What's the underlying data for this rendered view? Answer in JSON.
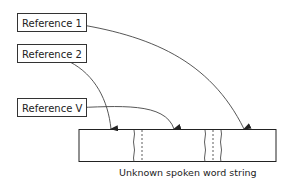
{
  "diagram": {
    "references": [
      {
        "label": "Reference 1"
      },
      {
        "label": "Reference 2"
      },
      {
        "label": "Reference V"
      }
    ],
    "unknown_string": {
      "caption": "Unknown spoken word string"
    }
  }
}
